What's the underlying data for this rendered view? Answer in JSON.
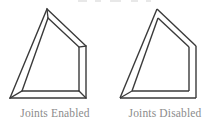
{
  "page": {
    "width": 220,
    "height": 129,
    "background_color": "#ffffff",
    "stroke_color": "#3a3a3a",
    "caption_color": "#8c8c8c",
    "top_artifact_color": "#e8e8e8"
  },
  "figures": [
    {
      "id": "joints-enabled",
      "caption": "Joints Enabled",
      "description": "Wedge outline drawn with mitered stroke joins; corners meet in sharp points",
      "joins": "miter",
      "outline": {
        "outer": [
          [
            47,
            9
          ],
          [
            86,
            46
          ],
          [
            86,
            98
          ],
          [
            10,
            98
          ]
        ],
        "inner": [
          [
            48,
            18
          ],
          [
            79,
            47
          ],
          [
            79,
            91
          ],
          [
            22,
            91
          ]
        ]
      },
      "stroke_width": 1.4
    },
    {
      "id": "joints-disabled",
      "caption": "Joints Disabled",
      "description": "Same wedge outline drawn with butt-cap independent segments; corners show notches and overhangs",
      "joins": "none",
      "outline": {
        "outer": [
          [
            47,
            9
          ],
          [
            86,
            46
          ],
          [
            86,
            98
          ],
          [
            10,
            98
          ]
        ],
        "inner": [
          [
            48,
            18
          ],
          [
            79,
            47
          ],
          [
            79,
            91
          ],
          [
            22,
            91
          ]
        ]
      },
      "stroke_width": 1.4
    }
  ],
  "top_artifacts": [
    {
      "left": 78,
      "width": 9
    },
    {
      "left": 95,
      "width": 6
    },
    {
      "left": 110,
      "width": 11
    },
    {
      "left": 131,
      "width": 7
    },
    {
      "left": 146,
      "width": 5
    }
  ]
}
